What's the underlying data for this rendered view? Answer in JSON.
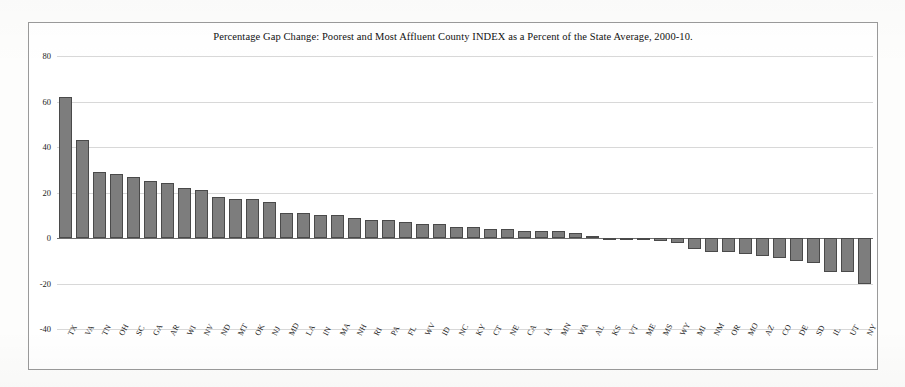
{
  "chart_data": {
    "type": "bar",
    "title": "Percentage Gap Change: Poorest and Most Affluent County INDEX as a Percent of the State Average, 2000-10.",
    "xlabel": "",
    "ylabel": "",
    "ylim": [
      -40,
      80
    ],
    "yticks": [
      80,
      60,
      40,
      20,
      0,
      -20,
      -40
    ],
    "ytick_labels": [
      "80",
      "60",
      "40",
      "20",
      "0",
      "-20",
      "-40"
    ],
    "grid": true,
    "legend": "none",
    "bar_color": "#7d7d7d",
    "bar_border_color": "#4a4a4a",
    "categories": [
      "TX",
      "VA",
      "TN",
      "OH",
      "SC",
      "GA",
      "AR",
      "WI",
      "NV",
      "ND",
      "MT",
      "OK",
      "NJ",
      "MD",
      "LA",
      "IN",
      "MA",
      "NH",
      "RI",
      "PA",
      "FL",
      "WV",
      "ID",
      "NC",
      "KY",
      "CT",
      "NE",
      "CA",
      "IA",
      "MN",
      "WA",
      "AL",
      "KS",
      "VT",
      "ME",
      "MS",
      "WY",
      "MI",
      "NM",
      "OR",
      "MO",
      "AZ",
      "CO",
      "DE",
      "SD",
      "IL",
      "UT",
      "NY"
    ],
    "values": [
      62,
      43,
      29,
      28,
      27,
      25,
      24,
      22,
      21,
      18,
      17,
      17,
      16,
      11,
      11,
      10,
      10,
      9,
      8,
      8,
      7,
      6,
      6,
      5,
      5,
      4,
      4,
      3,
      3,
      3,
      2,
      1,
      0,
      -0.5,
      -1,
      -1.5,
      -2,
      -5,
      -6,
      -6,
      -7,
      -8,
      -9,
      -10,
      -11,
      -15,
      -15,
      -20
    ]
  }
}
